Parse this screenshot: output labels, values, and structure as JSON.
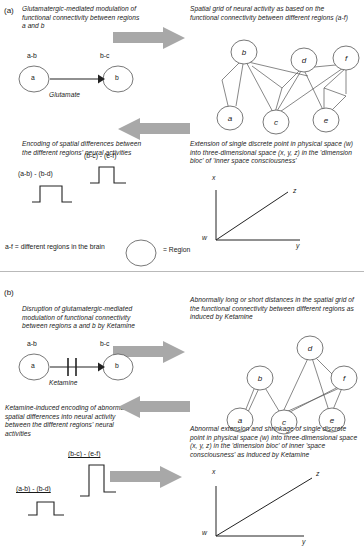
{
  "figure": {
    "panels": [
      {
        "id": "a",
        "label": "(a)",
        "captions": {
          "top_left": "Glutamatergic-mediated modulation of functional connectivity between regions a and b",
          "top_right": "Spatial grid of neural activity as based on the functional connectivity between different regions (a-f)",
          "mid_left": "Encoding of spatial differences between the different regions' neural activities",
          "mid_right": "Extension of single discrete point in physical space (w) into three-dimensional space (x, y, z) in the 'dimension bloc' of 'inner space consciousness'"
        },
        "connectivity": {
          "source_label": "a-b",
          "target_label": "b-c",
          "source_node": "a",
          "target_node": "b",
          "mediator": "Glutamate"
        },
        "graph": {
          "nodes": [
            "a",
            "b",
            "c",
            "d",
            "e",
            "f"
          ],
          "edges": [
            [
              "a",
              "b"
            ],
            [
              "a",
              "d"
            ],
            [
              "b",
              "c"
            ],
            [
              "b",
              "d"
            ],
            [
              "c",
              "d"
            ],
            [
              "c",
              "f"
            ],
            [
              "d",
              "e"
            ],
            [
              "d",
              "f"
            ],
            [
              "e",
              "f"
            ],
            [
              "b",
              "f"
            ]
          ]
        },
        "pulses": [
          {
            "label": "(a-b) - (b-d)",
            "width": "wide",
            "height": "short",
            "underline": false
          },
          {
            "label": "(b-c) - (e-f)",
            "width": "narrow",
            "height": "short",
            "underline": false
          }
        ],
        "space": {
          "origin": "w",
          "vertical": "x",
          "horizontal": "y",
          "diagonal": "z"
        }
      },
      {
        "id": "b",
        "label": "(b)",
        "captions": {
          "top_left": "Disruption of glutamatergic-mediated modulation of functional connectivity between regions a and b by Ketamine",
          "top_right": "Abnormally long or short distances in the spatial grid of the functional connectivity between different regions as induced by Ketamine",
          "mid_left": "Ketamine-induced encoding of abnormal spatial differences into neural activity between the different regions' neural activities",
          "mid_right": "Abnormal extension and shrinkage of single discrete point in physical space (w) into three-dimensional space (x, y, z) in the 'dimension bloc' of inner 'space consciousness' as induced by Ketamine"
        },
        "connectivity": {
          "source_label": "a-b",
          "target_label": "b-c",
          "source_node": "a",
          "target_node": "b",
          "mediator": "Ketamine",
          "blocked": true
        },
        "graph": {
          "nodes": [
            "a",
            "b",
            "c",
            "d",
            "e",
            "f"
          ],
          "edges": [
            [
              "a",
              "b"
            ],
            [
              "a",
              "b"
            ],
            [
              "b",
              "c"
            ],
            [
              "c",
              "d"
            ],
            [
              "d",
              "e"
            ],
            [
              "d",
              "f"
            ],
            [
              "c",
              "f"
            ],
            [
              "e",
              "f"
            ]
          ]
        },
        "pulses": [
          {
            "label": "(a-b) - (b-d)",
            "width": "narrow",
            "height": "short",
            "underline": true
          },
          {
            "label": "(b-c) - (e-f)",
            "width": "narrow",
            "height": "tall",
            "underline": true
          }
        ],
        "space": {
          "origin": "w",
          "vertical": "x",
          "horizontal": "y",
          "diagonal": "z"
        }
      }
    ],
    "legend": {
      "regions_note": "a-f = different regions in the brain",
      "circle_meaning": "= Region"
    },
    "colors": {
      "arrow_gray": "#a8a8a8",
      "line_black": "#2b2b2b",
      "text": "#1a1a1a"
    }
  }
}
